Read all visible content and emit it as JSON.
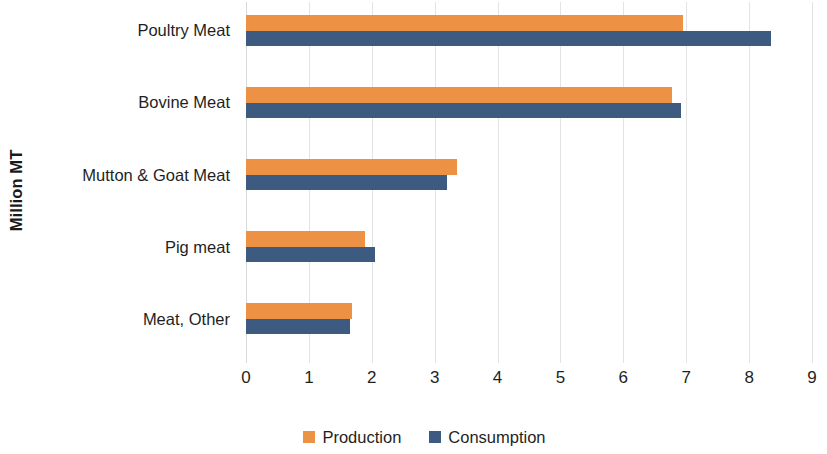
{
  "chart_data": {
    "type": "bar",
    "orientation": "horizontal",
    "title": "",
    "xlabel": "",
    "ylabel": "Million MT",
    "categories": [
      "Poultry Meat",
      "Bovine Meat",
      "Mutton & Goat Meat",
      "Pig meat",
      "Meat, Other"
    ],
    "series": [
      {
        "name": "Production",
        "color": "#ED9145",
        "values": [
          6.95,
          6.78,
          3.35,
          1.9,
          1.68
        ]
      },
      {
        "name": "Consumption",
        "color": "#3D5A80",
        "values": [
          8.35,
          6.92,
          3.2,
          2.05,
          1.65
        ]
      }
    ],
    "xlim": [
      0,
      9
    ],
    "xticks": [
      "0",
      "1",
      "2",
      "3",
      "4",
      "5",
      "6",
      "7",
      "8",
      "9"
    ],
    "grid": true,
    "grid_axis": "x",
    "legend_position": "bottom"
  },
  "axes": {
    "y_title": "Million MT"
  },
  "legend": {
    "entries": [
      {
        "label": "Production",
        "swatch": "production"
      },
      {
        "label": "Consumption",
        "swatch": "consumption"
      }
    ]
  }
}
